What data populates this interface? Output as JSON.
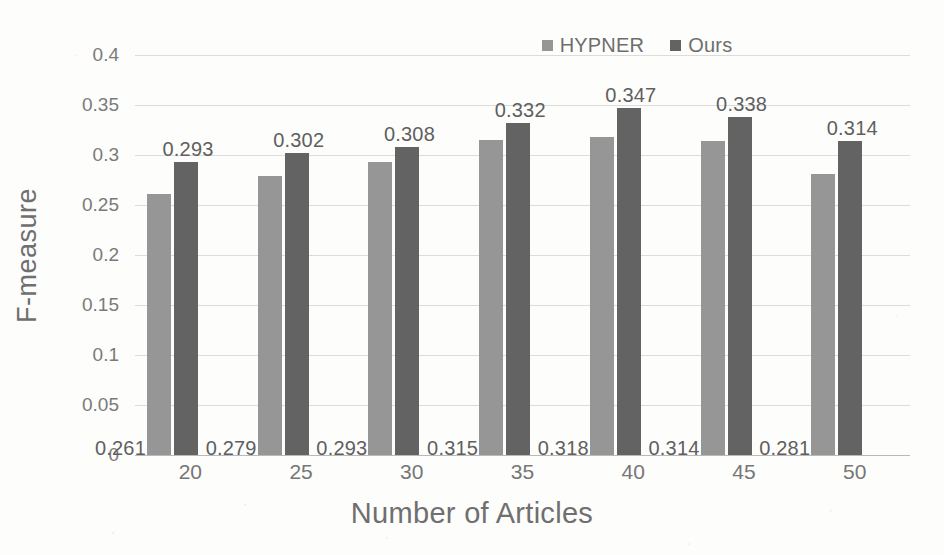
{
  "chart_data": {
    "type": "bar",
    "title": "",
    "xlabel": "Number of Articles",
    "ylabel": "F-measure",
    "categories": [
      "20",
      "25",
      "30",
      "35",
      "40",
      "45",
      "50"
    ],
    "series": [
      {
        "name": "HYPNER",
        "color": "#969696",
        "values": [
          0.261,
          0.279,
          0.293,
          0.315,
          0.318,
          0.314,
          0.281
        ]
      },
      {
        "name": "Ours",
        "color": "#636363",
        "values": [
          0.293,
          0.302,
          0.308,
          0.332,
          0.347,
          0.338,
          0.314
        ]
      }
    ],
    "value_labels": {
      "HYPNER": [
        "0.261",
        "0.279",
        "0.293",
        "0.315",
        "0.318",
        "0.314",
        "0.281"
      ],
      "Ours": [
        "0.293",
        "0.302",
        "0.308",
        "0.332",
        "0.347",
        "0.338",
        "0.314"
      ]
    },
    "ylim": [
      0,
      0.4
    ],
    "yticks": [
      0,
      0.05,
      0.1,
      0.15,
      0.2,
      0.25,
      0.3,
      0.35,
      0.4
    ],
    "ytick_labels": [
      "0",
      "0.05",
      "0.1",
      "0.15",
      "0.2",
      "0.25",
      "0.3",
      "0.35",
      "0.4"
    ],
    "grid": true,
    "legend_position": "top-right",
    "legend": [
      {
        "label": "HYPNER",
        "color": "#969696"
      },
      {
        "label": "Ours",
        "color": "#636363"
      }
    ]
  }
}
